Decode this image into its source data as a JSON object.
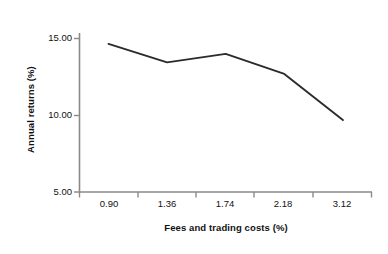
{
  "chart_data": {
    "type": "line",
    "title": "",
    "xlabel": "Fees and trading costs (%)",
    "ylabel": "Annual returns (%)",
    "categories": [
      "0.90",
      "1.36",
      "1.74",
      "2.18",
      "3.12"
    ],
    "x": [
      0.9,
      1.36,
      1.74,
      2.18,
      3.12
    ],
    "values": [
      14.65,
      13.45,
      14.0,
      12.7,
      9.7
    ],
    "series": [
      {
        "name": "Annual returns",
        "values": [
          14.65,
          13.45,
          14.0,
          12.7,
          9.7
        ],
        "color": "#2b2b2b"
      }
    ],
    "ylim": [
      5.0,
      15.0
    ],
    "yticks": [
      5.0,
      10.0,
      15.0
    ],
    "ytick_labels": [
      "5.00",
      "10.00",
      "15.00"
    ],
    "xtick_labels": [
      "0.90",
      "1.36",
      "1.74",
      "2.18",
      "3.12"
    ],
    "grid": false,
    "legend": null,
    "legend_position": "none",
    "axis_color": "#8a8a8a",
    "line_color": "#2b2b2b",
    "background": "#ffffff"
  },
  "axes": {
    "y_title": "Annual returns (%)",
    "x_title": "Fees and trading costs (%)"
  },
  "ticks": {
    "y": [
      {
        "label": "15.00",
        "value": 15.0
      },
      {
        "label": "10.00",
        "value": 10.0
      },
      {
        "label": "5.00",
        "value": 5.0
      }
    ],
    "x": [
      {
        "label": "0.90",
        "value": 0.9
      },
      {
        "label": "1.36",
        "value": 1.36
      },
      {
        "label": "1.74",
        "value": 1.74
      },
      {
        "label": "2.18",
        "value": 2.18
      },
      {
        "label": "3.12",
        "value": 3.12
      }
    ]
  }
}
